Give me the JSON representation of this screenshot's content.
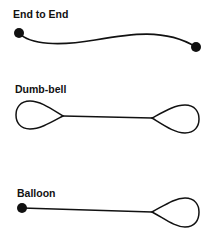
{
  "diagram": {
    "panels": [
      {
        "id": "end-to-end",
        "label": "End to End"
      },
      {
        "id": "dumb-bell",
        "label": "Dumb-bell"
      },
      {
        "id": "balloon",
        "label": "Balloon"
      }
    ],
    "colors": {
      "stroke": "#111111",
      "background": "#ffffff"
    }
  }
}
